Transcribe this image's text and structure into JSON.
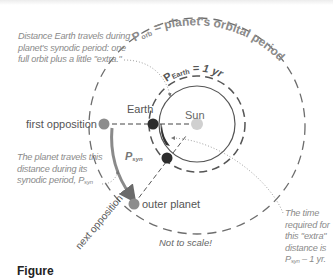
{
  "diagram": {
    "title_orbit_outer": {
      "symbol": "P",
      "subscript": "orb",
      "text": " = planet's orbital period"
    },
    "title_orbit_earth": {
      "symbol": "P",
      "subscript": "Earth",
      "text": " = 1 yr"
    },
    "labels": {
      "sun": "Sun",
      "earth": "Earth",
      "first_opposition": "first opposition",
      "outer_planet": "outer planet",
      "next_opposition": "next opposition",
      "p_syn_symbol": "P",
      "p_syn_subscript": "syn",
      "not_to_scale": "Not to scale!"
    },
    "notes": {
      "earth_distance": [
        "Distance Earth travels during",
        "planet's synodic period: one",
        "full orbit plus a little \"extra.\""
      ],
      "planet_distance_lines": [
        "The planet travels this",
        "distance during its",
        "synodic period, "
      ],
      "planet_distance_symbol": "P",
      "planet_distance_subscript": "syn",
      "extra_time_lines": [
        "The time",
        "required for",
        "this \"extra\"",
        "distance is"
      ],
      "extra_time_symbol": "P",
      "extra_time_subscript": "syn",
      "extra_time_suffix": " – 1 yr."
    },
    "caption": "Figure"
  },
  "colors": {
    "dashed_orbit": "#6d6d6d",
    "earth_dot": "#2d2d2d",
    "planet_dot": "#8c8c8c",
    "sun_dot": "#d0d0d0",
    "arrow": "#7a7a7a",
    "note_text": "#8a8a8a",
    "label_text": "#555555",
    "title_text": "#8a8a8a"
  }
}
